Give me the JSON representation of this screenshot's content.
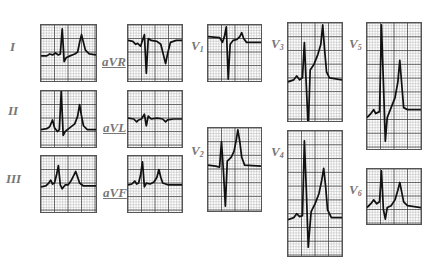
{
  "figure": {
    "colors": {
      "grid_minor": "#9a9a9a",
      "grid_major": "#333333",
      "trace": "#111111",
      "label": "#777777"
    }
  },
  "leads": [
    {
      "id": "I",
      "label": "I",
      "sub": "",
      "underline": false,
      "box": [
        40,
        24,
        57,
        58
      ],
      "label_pos": [
        10,
        40
      ],
      "trace": "M0,32 L6,32 L9,30 L12,31 L15,29 L18,31 L20,30 L22,4 L24,38 L26,34 L30,32 L35,30 L38,28 L40,18 L42,10 L44,18 L46,26 L50,30 L57,31"
    },
    {
      "id": "II",
      "label": "II",
      "sub": "",
      "underline": false,
      "box": [
        40,
        90,
        57,
        58
      ],
      "label_pos": [
        8,
        104
      ],
      "trace": "M0,40 L6,39 L9,37 L12,30 L14,38 L17,42 L19,40 L21,0 L23,46 L25,42 L30,38 L35,34 L38,26 L40,14 L42,26 L44,36 L48,40 L57,40"
    },
    {
      "id": "III",
      "label": "III",
      "sub": "",
      "underline": false,
      "box": [
        40,
        155,
        57,
        58
      ],
      "label_pos": [
        6,
        172
      ],
      "trace": "M0,32 L5,31 L8,28 L10,25 L12,29 L14,28 L16,20 L18,10 L20,30 L22,34 L25,30 L28,30 L31,26 L34,20 L36,16 L38,22 L40,28 L44,31 L57,31"
    },
    {
      "id": "aVR",
      "label": "aVR",
      "sub": "",
      "underline": true,
      "box": [
        127,
        24,
        56,
        58
      ],
      "label_pos": [
        102,
        55
      ],
      "trace": "M0,16 L5,17 L8,20 L10,19 L13,22 L15,16 L17,10 L19,50 L21,14 L24,16 L30,17 L34,20 L37,32 L39,40 L41,30 L44,18 L50,16 L56,16"
    },
    {
      "id": "aVL",
      "label": "aVL",
      "sub": "",
      "underline": true,
      "box": [
        127,
        90,
        56,
        58
      ],
      "label_pos": [
        103,
        121
      ],
      "trace": "M0,28 L6,29 L9,32 L11,30 L14,29 L17,24 L19,36 L21,26 L24,29 L30,28 L36,29 L39,32 L41,30 L47,29 L56,29"
    },
    {
      "id": "aVF",
      "label": "aVF",
      "sub": "",
      "underline": true,
      "box": [
        127,
        155,
        56,
        58
      ],
      "label_pos": [
        103,
        186
      ],
      "trace": "M0,30 L4,29 L7,26 L9,29 L11,28 L13,20 L15,6 L17,32 L19,28 L23,29 L27,27 L30,22 L32,14 L34,22 L36,28 L42,30 L56,30"
    },
    {
      "id": "V1",
      "label": "V",
      "sub": "1",
      "underline": false,
      "box": [
        207,
        24,
        55,
        58
      ],
      "label_pos": [
        191,
        39
      ],
      "trace": "M0,12 L12,13 L15,18 L17,12 L19,2 L21,56 L23,20 L26,16 L30,15 L33,12 L35,8 L37,14 L40,18 L55,18"
    },
    {
      "id": "V2",
      "label": "V",
      "sub": "2",
      "underline": false,
      "box": [
        207,
        127,
        55,
        85
      ],
      "label_pos": [
        191,
        144
      ],
      "trace": "M0,38 L8,39 L12,40 L14,14 L16,44 L18,80 L20,34 L24,30 L27,24 L29,14 L31,2 L33,14 L35,30 L38,38 L55,39"
    },
    {
      "id": "V3",
      "label": "V",
      "sub": "3",
      "underline": false,
      "box": [
        287,
        22,
        56,
        100
      ],
      "label_pos": [
        271,
        37
      ],
      "trace": "M0,60 L6,58 L9,54 L12,58 L15,56 L17,20 L19,64 L21,108 L23,48 L27,42 L31,32 L34,22 L36,2 L38,28 L40,50 L43,56 L56,58"
    },
    {
      "id": "V4",
      "label": "V",
      "sub": "4",
      "underline": false,
      "box": [
        287,
        130,
        56,
        127
      ],
      "label_pos": [
        271,
        145
      ],
      "trace": "M0,90 L6,88 L9,84 L12,87 L15,86 L17,10 L19,60 L21,118 L24,82 L28,74 L32,64 L35,50 L37,38 L39,56 L41,80 L45,88 L56,88"
    },
    {
      "id": "V5",
      "label": "V",
      "sub": "5",
      "underline": false,
      "box": [
        366,
        22,
        56,
        128
      ],
      "label_pos": [
        349,
        37
      ],
      "trace": "M0,96 L4,92 L7,88 L9,92 L13,90 L15,2 L17,60 L19,120 L21,96 L25,86 L29,76 L32,60 L34,38 L36,62 L38,86 L42,88 L56,88"
    },
    {
      "id": "V6",
      "label": "V",
      "sub": "6",
      "underline": false,
      "box": [
        366,
        168,
        56,
        57
      ],
      "label_pos": [
        349,
        183
      ],
      "trace": "M0,40 L4,36 L7,32 L10,36 L13,34 L15,2 L17,42 L19,52 L21,40 L25,38 L29,32 L32,22 L34,14 L36,24 L38,34 L42,38 L56,40"
    }
  ]
}
